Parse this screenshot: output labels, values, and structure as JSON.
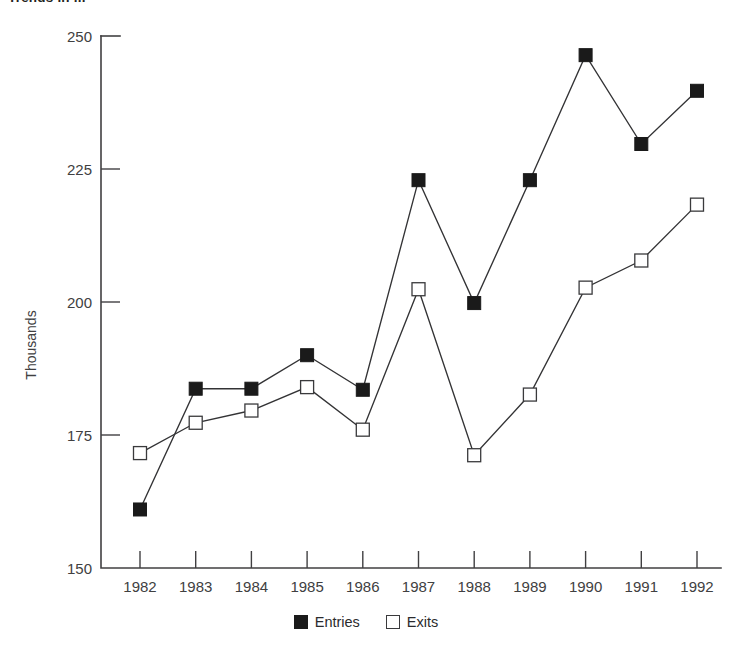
{
  "chart_data": {
    "type": "line",
    "title": "",
    "xlabel": "",
    "ylabel": "Thousands",
    "ylim": [
      150,
      250
    ],
    "yticks": [
      150,
      175,
      200,
      225,
      250
    ],
    "grid": false,
    "legend_position": "bottom-center",
    "categories": [
      "1982",
      "1983",
      "1984",
      "1985",
      "1986",
      "1987",
      "1988",
      "1989",
      "1990",
      "1991",
      "1992"
    ],
    "series": [
      {
        "name": "Entries",
        "marker": "filled-square",
        "color": "#1a1a1a",
        "values": [
          161,
          183.7,
          183.7,
          190,
          183.5,
          222.9,
          199.8,
          222.9,
          246.4,
          229.7,
          239.7
        ]
      },
      {
        "name": "Exits",
        "marker": "hollow-square",
        "color": "#ffffff",
        "values": [
          171.6,
          177.3,
          179.6,
          184,
          176,
          202.4,
          171.2,
          182.6,
          202.7,
          207.8,
          218.3
        ]
      }
    ]
  },
  "figure": {
    "title_clipped": "Trends in ...",
    "axis_label_y": "Thousands",
    "y_tick_labels": [
      "250",
      "225",
      "200",
      "175",
      "150"
    ],
    "x_tick_labels": [
      "1982",
      "1983",
      "1984",
      "1985",
      "1986",
      "1987",
      "1988",
      "1989",
      "1990",
      "1991",
      "1992"
    ],
    "legend": [
      {
        "label": "Entries",
        "swatch": "filled-square"
      },
      {
        "label": "Exits",
        "swatch": "hollow-square"
      }
    ],
    "colors": {
      "axis": "#414042",
      "line": "#333335",
      "entries_marker": "#1a1a1a",
      "exits_marker": "#ffffff",
      "text": "#404041",
      "background": "#ffffff"
    }
  }
}
